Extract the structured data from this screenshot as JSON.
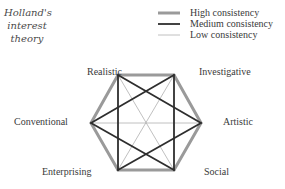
{
  "title": {
    "lines": [
      "Holland's",
      "interest",
      "theory"
    ]
  },
  "legend": {
    "items": [
      {
        "label": "High consistency",
        "color": "#9a9a9a",
        "width": 3
      },
      {
        "label": "Medium consistency",
        "color": "#2e2e2e",
        "width": 1.8
      },
      {
        "label": "Low consistency",
        "color": "#b0b0b0",
        "width": 0.8
      }
    ]
  },
  "nodes": {
    "realistic": {
      "label": "Realistic",
      "x": 118,
      "y": 75
    },
    "investigative": {
      "label": "Investigative",
      "x": 174,
      "y": 75
    },
    "artistic": {
      "label": "Artistic",
      "x": 201,
      "y": 123
    },
    "social": {
      "label": "Social",
      "x": 174,
      "y": 170
    },
    "enterprising": {
      "label": "Enterprising",
      "x": 118,
      "y": 170
    },
    "conventional": {
      "label": "Conventional",
      "x": 91,
      "y": 123
    }
  },
  "edges": {
    "high": [
      [
        "realistic",
        "investigative"
      ],
      [
        "investigative",
        "artistic"
      ],
      [
        "artistic",
        "social"
      ],
      [
        "social",
        "enterprising"
      ],
      [
        "enterprising",
        "conventional"
      ],
      [
        "conventional",
        "realistic"
      ]
    ],
    "medium": [
      [
        "realistic",
        "artistic"
      ],
      [
        "realistic",
        "enterprising"
      ],
      [
        "investigative",
        "conventional"
      ],
      [
        "investigative",
        "social"
      ],
      [
        "artistic",
        "enterprising"
      ],
      [
        "social",
        "conventional"
      ]
    ],
    "low": [
      [
        "realistic",
        "social"
      ],
      [
        "investigative",
        "enterprising"
      ],
      [
        "conventional",
        "artistic"
      ]
    ]
  }
}
